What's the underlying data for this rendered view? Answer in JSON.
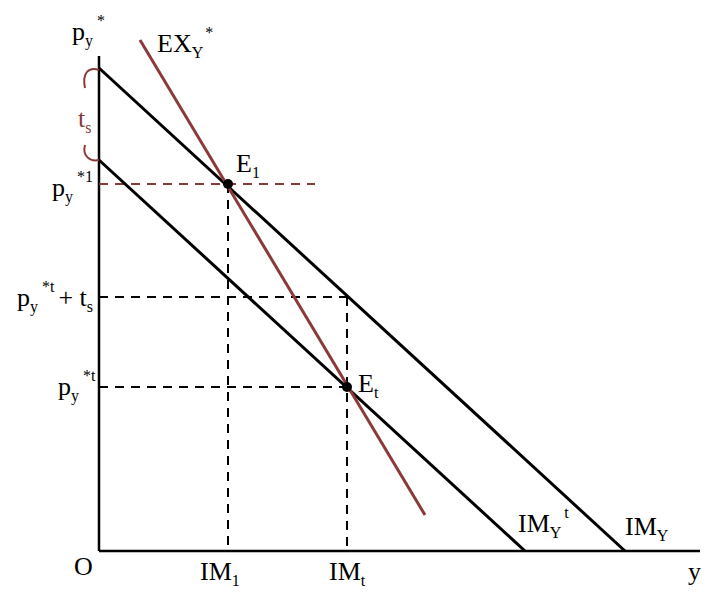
{
  "colors": {
    "axis": "#000000",
    "import_curves": "#000000",
    "export_curve": "#8b3a3a",
    "dashed_guides": "#000000",
    "red_guide": "#8b3a3a"
  },
  "axes": {
    "origin_label": "O",
    "y_axis": {
      "base": "p",
      "sub": "y",
      "sup": "*"
    },
    "x_axis": {
      "label": "y"
    }
  },
  "curves": {
    "export": {
      "base": "EX",
      "sub": "Y",
      "sup": "*"
    },
    "import": {
      "base": "IM",
      "sub": "Y",
      "sup": ""
    },
    "import_tariff": {
      "base": "IM",
      "sub": "Y",
      "sup": "t"
    }
  },
  "points": {
    "e1": {
      "base": "E",
      "sub": "1"
    },
    "et": {
      "base": "E",
      "sub": "t"
    }
  },
  "price_labels": {
    "p1": {
      "base": "p",
      "sub": "y",
      "sup": "*1",
      "suffix": ""
    },
    "pt_plus_ts": {
      "base": "p",
      "sub": "y",
      "sup": "*t",
      "plus": "+ t",
      "plus_sub": "s"
    },
    "pt": {
      "base": "p",
      "sub": "y",
      "sup": "*t"
    }
  },
  "quantity_labels": {
    "im1": {
      "base": "IM",
      "sub": "1"
    },
    "imt": {
      "base": "IM",
      "sub": "t"
    }
  },
  "tariff": {
    "base": "t",
    "sub": "s"
  }
}
